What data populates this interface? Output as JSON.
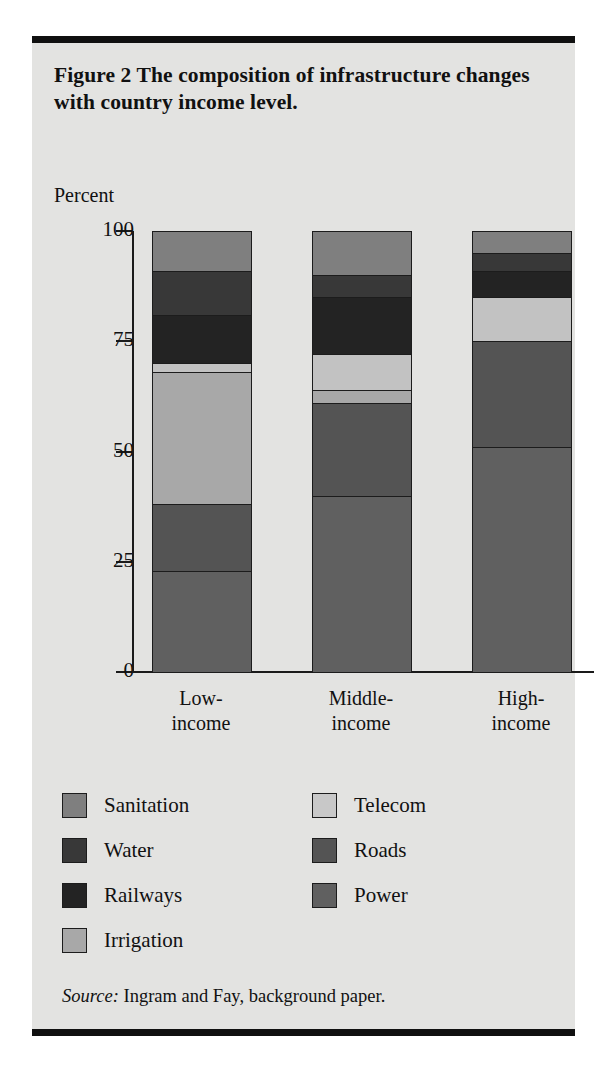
{
  "figure": {
    "title": "Figure 2  The composition of infrastructure changes with country income level.",
    "source_prefix": "Source:",
    "source_text": " Ingram and Fay, background paper."
  },
  "chart_data": {
    "type": "bar",
    "stacked": true,
    "title": "Figure 2  The composition of infrastructure changes with country income level.",
    "xlabel": "",
    "ylabel": "Percent",
    "ylim": [
      0,
      100
    ],
    "yticks": [
      0,
      25,
      50,
      75,
      100
    ],
    "ytick_labels": [
      "0",
      "25",
      "50",
      "75",
      "100"
    ],
    "grid": false,
    "legend_position": "below-plot",
    "categories": [
      "Low-income",
      "Middle-income",
      "High-income"
    ],
    "category_labels": [
      {
        "line1": "Low-",
        "line2": "income"
      },
      {
        "line1": "Middle-",
        "line2": "income"
      },
      {
        "line1": "High-",
        "line2": "income"
      }
    ],
    "series": [
      {
        "name": "Power",
        "color": "#606060",
        "values": [
          23,
          40,
          51
        ]
      },
      {
        "name": "Roads",
        "color": "#545454",
        "values": [
          15,
          21,
          24
        ]
      },
      {
        "name": "Telecom",
        "color": "#c2c2c2",
        "values": [
          2,
          8,
          10
        ]
      },
      {
        "name": "Irrigation",
        "color": "#a8a8a8",
        "values": [
          30,
          3,
          0
        ]
      },
      {
        "name": "Railways",
        "color": "#232323",
        "values": [
          11,
          13,
          6
        ]
      },
      {
        "name": "Water",
        "color": "#383838",
        "values": [
          10,
          5,
          4
        ]
      },
      {
        "name": "Sanitation",
        "color": "#7f7f7f",
        "values": [
          9,
          10,
          5
        ]
      }
    ],
    "stack_order_top_to_bottom": [
      "Sanitation",
      "Water",
      "Railways",
      "Telecom",
      "Irrigation",
      "Roads",
      "Power"
    ],
    "annotations": []
  },
  "legend": {
    "items": [
      {
        "label": "Sanitation",
        "color": "#7f7f7f"
      },
      {
        "label": "Telecom",
        "color": "#c8c8c8"
      },
      {
        "label": "Water",
        "color": "#383838"
      },
      {
        "label": "Roads",
        "color": "#545454"
      },
      {
        "label": "Railways",
        "color": "#232323"
      },
      {
        "label": "Power",
        "color": "#606060"
      },
      {
        "label": "Irrigation",
        "color": "#a8a8a8"
      }
    ]
  }
}
